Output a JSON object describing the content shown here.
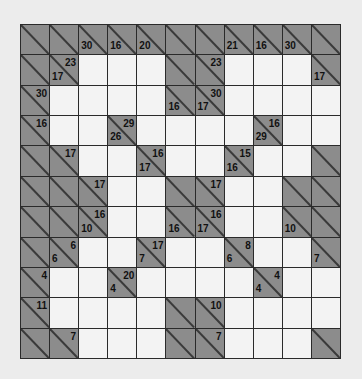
{
  "puzzle": {
    "type": "kakuro",
    "rows": 11,
    "cols": 11,
    "colors": {
      "block": "#8c8c8c",
      "entry": "#f3f3f3",
      "grid_line": "#2a2a2a",
      "background": "#ececec"
    },
    "grid": [
      [
        {
          "t": "b"
        },
        {
          "t": "b"
        },
        {
          "t": "b",
          "down": "30"
        },
        {
          "t": "b",
          "down": "16"
        },
        {
          "t": "b",
          "down": "20"
        },
        {
          "t": "b"
        },
        {
          "t": "b"
        },
        {
          "t": "b",
          "down": "21"
        },
        {
          "t": "b",
          "down": "16"
        },
        {
          "t": "b",
          "down": "30"
        },
        {
          "t": "b"
        }
      ],
      [
        {
          "t": "b"
        },
        {
          "t": "b",
          "across": "23",
          "down": "17"
        },
        {
          "t": "w"
        },
        {
          "t": "w"
        },
        {
          "t": "w"
        },
        {
          "t": "b"
        },
        {
          "t": "b",
          "across": "23"
        },
        {
          "t": "w"
        },
        {
          "t": "w"
        },
        {
          "t": "w"
        },
        {
          "t": "b",
          "down": "17"
        }
      ],
      [
        {
          "t": "b",
          "across": "30"
        },
        {
          "t": "w"
        },
        {
          "t": "w"
        },
        {
          "t": "w"
        },
        {
          "t": "w"
        },
        {
          "t": "b",
          "down": "16"
        },
        {
          "t": "b",
          "across": "30",
          "down": "17"
        },
        {
          "t": "w"
        },
        {
          "t": "w"
        },
        {
          "t": "w"
        },
        {
          "t": "w"
        }
      ],
      [
        {
          "t": "b",
          "across": "16"
        },
        {
          "t": "w"
        },
        {
          "t": "w"
        },
        {
          "t": "b",
          "across": "29",
          "down": "26"
        },
        {
          "t": "w"
        },
        {
          "t": "w"
        },
        {
          "t": "w"
        },
        {
          "t": "w"
        },
        {
          "t": "b",
          "across": "16",
          "down": "29"
        },
        {
          "t": "w"
        },
        {
          "t": "w"
        }
      ],
      [
        {
          "t": "b"
        },
        {
          "t": "b",
          "across": "17"
        },
        {
          "t": "w"
        },
        {
          "t": "w"
        },
        {
          "t": "b",
          "across": "16",
          "down": "17"
        },
        {
          "t": "w"
        },
        {
          "t": "w"
        },
        {
          "t": "b",
          "across": "15",
          "down": "16"
        },
        {
          "t": "w"
        },
        {
          "t": "w"
        },
        {
          "t": "b"
        }
      ],
      [
        {
          "t": "b"
        },
        {
          "t": "b"
        },
        {
          "t": "b",
          "across": "17"
        },
        {
          "t": "w"
        },
        {
          "t": "w"
        },
        {
          "t": "b"
        },
        {
          "t": "b",
          "across": "17"
        },
        {
          "t": "w"
        },
        {
          "t": "w"
        },
        {
          "t": "b"
        },
        {
          "t": "b"
        }
      ],
      [
        {
          "t": "b"
        },
        {
          "t": "b"
        },
        {
          "t": "b",
          "across": "16",
          "down": "10"
        },
        {
          "t": "w"
        },
        {
          "t": "w"
        },
        {
          "t": "b",
          "down": "16"
        },
        {
          "t": "b",
          "across": "16",
          "down": "17"
        },
        {
          "t": "w"
        },
        {
          "t": "w"
        },
        {
          "t": "b",
          "down": "10"
        },
        {
          "t": "b"
        }
      ],
      [
        {
          "t": "b"
        },
        {
          "t": "b",
          "across": "6",
          "down": "6"
        },
        {
          "t": "w"
        },
        {
          "t": "w"
        },
        {
          "t": "b",
          "across": "17",
          "down": "7"
        },
        {
          "t": "w"
        },
        {
          "t": "w"
        },
        {
          "t": "b",
          "across": "8",
          "down": "6"
        },
        {
          "t": "w"
        },
        {
          "t": "w"
        },
        {
          "t": "b",
          "down": "7"
        }
      ],
      [
        {
          "t": "b",
          "across": "4"
        },
        {
          "t": "w"
        },
        {
          "t": "w"
        },
        {
          "t": "b",
          "across": "20",
          "down": "4"
        },
        {
          "t": "w"
        },
        {
          "t": "w"
        },
        {
          "t": "w"
        },
        {
          "t": "w"
        },
        {
          "t": "b",
          "across": "4",
          "down": "4"
        },
        {
          "t": "w"
        },
        {
          "t": "w"
        }
      ],
      [
        {
          "t": "b",
          "across": "11"
        },
        {
          "t": "w"
        },
        {
          "t": "w"
        },
        {
          "t": "w"
        },
        {
          "t": "w"
        },
        {
          "t": "b"
        },
        {
          "t": "b",
          "across": "10"
        },
        {
          "t": "w"
        },
        {
          "t": "w"
        },
        {
          "t": "w"
        },
        {
          "t": "w"
        }
      ],
      [
        {
          "t": "b"
        },
        {
          "t": "b",
          "across": "7"
        },
        {
          "t": "w"
        },
        {
          "t": "w"
        },
        {
          "t": "w"
        },
        {
          "t": "b"
        },
        {
          "t": "b",
          "across": "7"
        },
        {
          "t": "w"
        },
        {
          "t": "w"
        },
        {
          "t": "w"
        },
        {
          "t": "b"
        }
      ]
    ]
  }
}
